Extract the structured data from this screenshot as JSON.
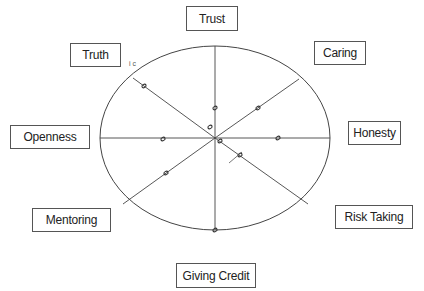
{
  "diagram": {
    "type": "values-wheel",
    "center": {
      "x": 215,
      "y": 138
    },
    "ellipse": {
      "rx": 115,
      "ry": 92
    },
    "stroke_color": "#444444",
    "labels": [
      {
        "id": "trust",
        "text": "Trust",
        "x": 186,
        "y": 6,
        "w": 52,
        "h": 25
      },
      {
        "id": "caring",
        "text": "Caring",
        "x": 314,
        "y": 41,
        "w": 52,
        "h": 24
      },
      {
        "id": "honesty",
        "text": "Honesty",
        "x": 348,
        "y": 121,
        "w": 53,
        "h": 24
      },
      {
        "id": "risk-taking",
        "text": "Risk Taking",
        "x": 335,
        "y": 205,
        "w": 78,
        "h": 24
      },
      {
        "id": "giving-credit",
        "text": "Giving Credit",
        "x": 176,
        "y": 263,
        "w": 80,
        "h": 25
      },
      {
        "id": "mentoring",
        "text": "Mentoring",
        "x": 32,
        "y": 208,
        "w": 79,
        "h": 24
      },
      {
        "id": "openness",
        "text": "Openness",
        "x": 10,
        "y": 125,
        "w": 80,
        "h": 24
      },
      {
        "id": "truth",
        "text": "Truth",
        "x": 70,
        "y": 43,
        "w": 51,
        "h": 24
      }
    ],
    "spokes": [
      {
        "id": "trust",
        "x2": 215,
        "y2": 46
      },
      {
        "id": "caring",
        "x2": 299,
        "y2": 79
      },
      {
        "id": "honesty",
        "x2": 330,
        "y2": 138
      },
      {
        "id": "risk-taking",
        "x2": 308,
        "y2": 204
      },
      {
        "id": "giving-credit",
        "x2": 215,
        "y2": 230
      },
      {
        "id": "mentoring",
        "x2": 123,
        "y2": 204
      },
      {
        "id": "openness",
        "x2": 100,
        "y2": 138
      },
      {
        "id": "truth",
        "x2": 133,
        "y2": 78
      }
    ],
    "marks": [
      {
        "id": "trust",
        "x": 215,
        "y": 108
      },
      {
        "id": "caring",
        "x": 258,
        "y": 108
      },
      {
        "id": "honesty",
        "x": 278,
        "y": 138
      },
      {
        "id": "risk-taking",
        "x": 240,
        "y": 155
      },
      {
        "id": "giving-credit",
        "x": 215,
        "y": 230
      },
      {
        "id": "mentoring",
        "x": 166,
        "y": 173
      },
      {
        "id": "openness",
        "x": 163,
        "y": 139
      },
      {
        "id": "truth",
        "x": 144,
        "y": 86
      },
      {
        "id": "center-a",
        "x": 210,
        "y": 127
      },
      {
        "id": "center-b",
        "x": 220,
        "y": 141
      }
    ],
    "annotation": {
      "text": "i c",
      "x": 129,
      "y": 60
    }
  }
}
